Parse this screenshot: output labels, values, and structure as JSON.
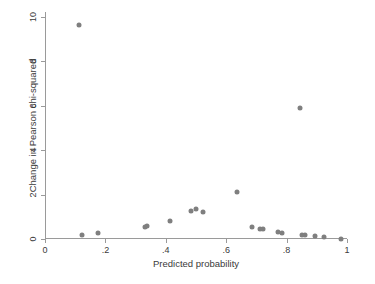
{
  "chart_data": {
    "type": "scatter",
    "title": "",
    "xlabel": "Predicted probability",
    "ylabel": "Change in Pearson chi-squared",
    "xlim": [
      0,
      1
    ],
    "ylim": [
      0,
      10
    ],
    "xticks": [
      0,
      0.2,
      0.4,
      0.6,
      0.8,
      1
    ],
    "xticklabels": [
      "0",
      ".2",
      ".4",
      ".6",
      ".8",
      "1"
    ],
    "yticks": [
      0,
      2,
      4,
      6,
      8,
      10
    ],
    "yticklabels": [
      "0",
      "2",
      "4",
      "6",
      "8",
      "10"
    ],
    "grid": false,
    "legend": null,
    "marker": {
      "shape": "circle",
      "color": "#7f7f7f",
      "size": 5
    },
    "x": [
      0.111,
      0.123,
      0.176,
      0.33,
      0.338,
      0.415,
      0.483,
      0.5,
      0.524,
      0.637,
      0.685,
      0.712,
      0.722,
      0.772,
      0.784,
      0.843,
      0.851,
      0.861,
      0.894,
      0.925,
      0.98
    ],
    "y": [
      9.64,
      0.16,
      0.25,
      0.56,
      0.6,
      0.83,
      1.26,
      1.34,
      1.21,
      2.12,
      0.53,
      0.45,
      0.44,
      0.32,
      0.29,
      5.9,
      0.19,
      0.17,
      0.14,
      0.1,
      0.02
    ],
    "points": [
      {
        "x": 0.111,
        "y": 9.64
      },
      {
        "x": 0.123,
        "y": 0.16
      },
      {
        "x": 0.176,
        "y": 0.25
      },
      {
        "x": 0.33,
        "y": 0.56
      },
      {
        "x": 0.338,
        "y": 0.6
      },
      {
        "x": 0.415,
        "y": 0.83
      },
      {
        "x": 0.483,
        "y": 1.26
      },
      {
        "x": 0.5,
        "y": 1.34
      },
      {
        "x": 0.524,
        "y": 1.21
      },
      {
        "x": 0.637,
        "y": 2.12
      },
      {
        "x": 0.685,
        "y": 0.53
      },
      {
        "x": 0.712,
        "y": 0.45
      },
      {
        "x": 0.722,
        "y": 0.44
      },
      {
        "x": 0.772,
        "y": 0.32
      },
      {
        "x": 0.784,
        "y": 0.29
      },
      {
        "x": 0.843,
        "y": 5.9
      },
      {
        "x": 0.851,
        "y": 0.19
      },
      {
        "x": 0.861,
        "y": 0.17
      },
      {
        "x": 0.894,
        "y": 0.14
      },
      {
        "x": 0.925,
        "y": 0.1
      },
      {
        "x": 0.98,
        "y": 0.02
      }
    ],
    "colors": {
      "marker": "#7f7f7f",
      "axis": "#9a9a9a",
      "text": "#3a3a3a",
      "background": "#ffffff"
    }
  }
}
